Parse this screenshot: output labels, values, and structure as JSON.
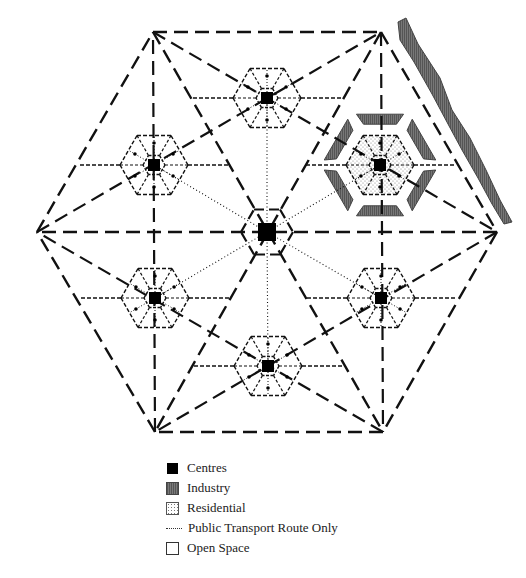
{
  "diagram": {
    "title": "",
    "colors": {
      "line": "#111111",
      "industry": "#666666",
      "residential_dots": "#777777",
      "centre": "#000000"
    },
    "outer_hexagon": [
      [
        153,
        32
      ],
      [
        381,
        32
      ],
      [
        497,
        232
      ],
      [
        383,
        432
      ],
      [
        155,
        432
      ],
      [
        37,
        232
      ]
    ],
    "main_centre": [
      267,
      232
    ],
    "satellite_centres": [
      {
        "name": "top",
        "pos": [
          267,
          98
        ]
      },
      {
        "name": "upper-left",
        "pos": [
          154,
          165
        ]
      },
      {
        "name": "upper-right",
        "pos": [
          380,
          165
        ],
        "highlighted": true
      },
      {
        "name": "lower-left",
        "pos": [
          155,
          298
        ]
      },
      {
        "name": "lower-right",
        "pos": [
          381,
          298
        ]
      },
      {
        "name": "bottom",
        "pos": [
          268,
          366
        ]
      }
    ]
  },
  "legend": {
    "items": [
      {
        "key": "centres",
        "label": "Centres"
      },
      {
        "key": "industry",
        "label": "Industry"
      },
      {
        "key": "residential",
        "label": "Residential"
      },
      {
        "key": "transport",
        "label": "Public Transport Route Only"
      },
      {
        "key": "open",
        "label": "Open Space"
      }
    ]
  }
}
